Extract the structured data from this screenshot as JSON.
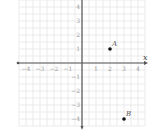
{
  "chart_data": {
    "type": "scatter",
    "title": "",
    "xlabel": "x",
    "ylabel": "y",
    "xlim": [
      -4.5,
      4.5
    ],
    "ylim": [
      -4.5,
      4.5
    ],
    "grid": true,
    "x_ticks": [
      -4,
      -3,
      -2,
      -1,
      1,
      2,
      3,
      4
    ],
    "y_ticks": [
      4,
      3,
      2,
      1,
      -1,
      -2,
      -3,
      -4
    ],
    "x_tick_labels": [
      "−4",
      "−3",
      "−2",
      "−1",
      "1",
      "2",
      "3",
      "4"
    ],
    "y_tick_labels": [
      "4",
      "3",
      "2",
      "1",
      "−1",
      "−2",
      "−3",
      "−4"
    ],
    "points": [
      {
        "label": "A",
        "x": 2,
        "y": 1
      },
      {
        "label": "B",
        "x": 3,
        "y": -4
      }
    ],
    "legend": null
  },
  "plot": {
    "origin_px": [
      82,
      63
    ],
    "unit_px": 14,
    "colors": {
      "grid": "#e6e6e6",
      "axis": "#555555",
      "point": "#111111",
      "tick_label": "#9a9a9a"
    }
  }
}
